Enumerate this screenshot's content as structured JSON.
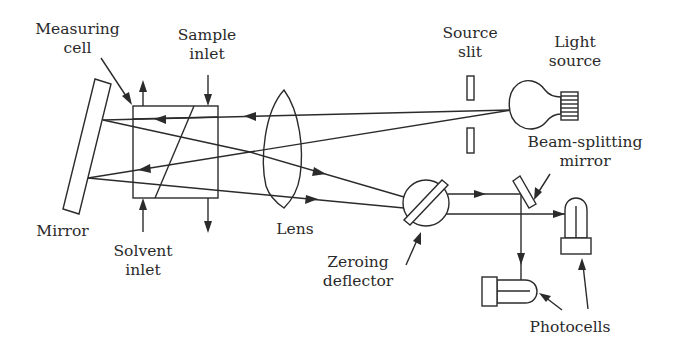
{
  "diagram": {
    "components": [
      {
        "id": "mirror",
        "label": "Mirror"
      },
      {
        "id": "measuring_cell",
        "label": "Measuring cell"
      },
      {
        "id": "sample_inlet",
        "label": "Sample inlet"
      },
      {
        "id": "solvent_inlet",
        "label": "Solvent inlet"
      },
      {
        "id": "lens",
        "label": "Lens"
      },
      {
        "id": "source_slit",
        "label": "Source slit"
      },
      {
        "id": "light_source",
        "label": "Light source"
      },
      {
        "id": "beam_splitting_mirror",
        "label": "Beam-splitting mirror"
      },
      {
        "id": "zeroing_deflector",
        "label": "Zeroing deflector"
      },
      {
        "id": "photocells",
        "label": "Photocells"
      }
    ]
  },
  "labels": {
    "measuring_cell_l1": "Measuring",
    "measuring_cell_l2": "cell",
    "sample_inlet_l1": "Sample",
    "sample_inlet_l2": "inlet",
    "source_slit_l1": "Source",
    "source_slit_l2": "slit",
    "light_source_l1": "Light",
    "light_source_l2": "source",
    "beam_splitting_l1": "Beam-splitting",
    "beam_splitting_l2": "mirror",
    "mirror": "Mirror",
    "solvent_inlet_l1": "Solvent",
    "solvent_inlet_l2": "inlet",
    "lens": "Lens",
    "zeroing_l1": "Zeroing",
    "zeroing_l2": "deflector",
    "photocells": "Photocells"
  },
  "colors": {
    "stroke": "#2b2b2b",
    "text": "#2a2a2a",
    "background": "#ffffff"
  }
}
